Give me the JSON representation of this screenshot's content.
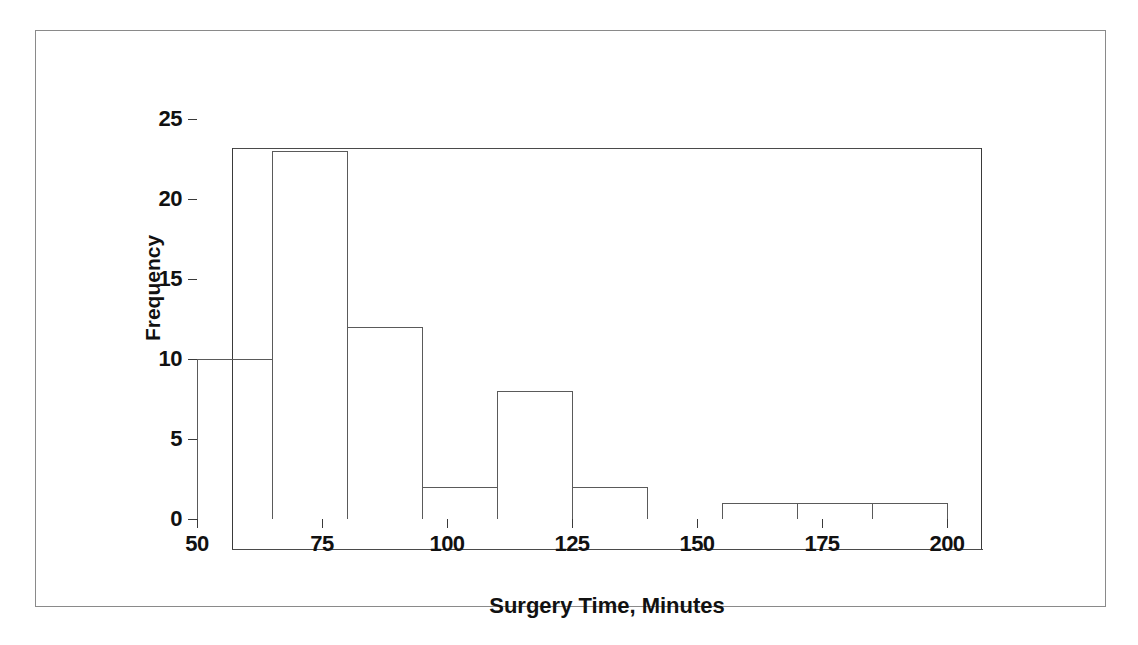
{
  "chart_data": {
    "type": "bar",
    "title": "",
    "subtitle": "",
    "xlabel": "Surgery Time, Minutes",
    "ylabel": "Frequency",
    "xlim": [
      50,
      200
    ],
    "ylim": [
      0,
      25
    ],
    "xticks": [
      50,
      75,
      100,
      125,
      150,
      175,
      200
    ],
    "xtick_labels": [
      "50",
      "75",
      "100",
      "125",
      "150",
      "175",
      "200"
    ],
    "yticks": [
      0,
      5,
      10,
      15,
      20,
      25
    ],
    "ytick_labels": [
      "0",
      "5",
      "10",
      "15",
      "20",
      "25"
    ],
    "grid": false,
    "legend": null,
    "bin_width": 15,
    "bin_edges": [
      50,
      65,
      80,
      95,
      110,
      125,
      140,
      155,
      170,
      185,
      200
    ],
    "categories": [
      "50-65",
      "65-80",
      "80-95",
      "95-110",
      "110-125",
      "125-140",
      "140-155",
      "155-170",
      "170-185",
      "185-200"
    ],
    "values": [
      10,
      23,
      12,
      2,
      8,
      2,
      0,
      1,
      1,
      1
    ],
    "bars": [
      {
        "label": "50-65",
        "x0": 50,
        "x1": 65,
        "value": 10
      },
      {
        "label": "65-80",
        "x0": 65,
        "x1": 80,
        "value": 23
      },
      {
        "label": "80-95",
        "x0": 80,
        "x1": 95,
        "value": 12
      },
      {
        "label": "95-110",
        "x0": 95,
        "x1": 110,
        "value": 2
      },
      {
        "label": "110-125",
        "x0": 110,
        "x1": 125,
        "value": 8
      },
      {
        "label": "125-140",
        "x0": 125,
        "x1": 140,
        "value": 2
      },
      {
        "label": "140-155",
        "x0": 140,
        "x1": 155,
        "value": 0
      },
      {
        "label": "155-170",
        "x0": 155,
        "x1": 170,
        "value": 1
      },
      {
        "label": "170-185",
        "x0": 170,
        "x1": 185,
        "value": 1
      },
      {
        "label": "185-200",
        "x0": 185,
        "x1": 200,
        "value": 1
      }
    ],
    "colors": {
      "bar_stroke": "#5a5a5a",
      "bar_fill": "#ffffff",
      "axis": "#3a3a3a",
      "text": "#111111",
      "background": "#ffffff",
      "frame": "#8a8a8a"
    }
  }
}
